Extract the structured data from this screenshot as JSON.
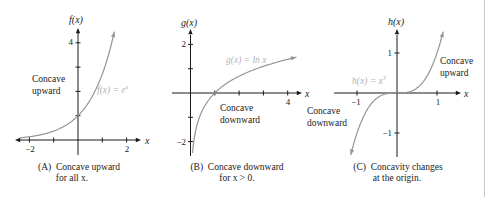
{
  "colors": {
    "axis": "#1a1a1a",
    "curve": "#949494",
    "curve_label": "#b2b2b2",
    "text": "#1a1a1a",
    "right_border": "#c6c6c6"
  },
  "chart_data": [
    {
      "type": "line",
      "panel": "A",
      "function": "f(x) = e^x",
      "fn": "exp",
      "title": "(A)  Concave upward",
      "title_line2": "for all x.",
      "y_axis_label": "f(x)",
      "x_axis_label": "x",
      "x_range_shown": [
        -2.6,
        2.6
      ],
      "y_range_shown": [
        -0.6,
        4.6
      ],
      "x_ticks": [
        -2,
        -1,
        1,
        2
      ],
      "y_ticks": [
        1,
        2,
        3,
        4
      ],
      "x_tick_labels": [
        {
          "value": -2,
          "text": "−2"
        },
        {
          "value": 2,
          "text": "2"
        }
      ],
      "y_tick_labels": [
        {
          "value": 4,
          "text": "4"
        }
      ],
      "key_points": [
        {
          "x": 0,
          "y": 1
        }
      ],
      "curve_label": {
        "base": "f(x) = e",
        "sup": "x"
      },
      "annotations": [
        {
          "role": "concavity-note",
          "lines": [
            "Concave",
            "upward"
          ]
        }
      ]
    },
    {
      "type": "line",
      "panel": "B",
      "function": "g(x) = ln x",
      "fn": "ln",
      "title": "(B)  Concave downward",
      "title_line2": "for x > 0.",
      "y_axis_label": "g(x)",
      "x_axis_label": "x",
      "x_range_shown": [
        -0.8,
        4.6
      ],
      "y_range_shown": [
        -2.6,
        2.6
      ],
      "x_ticks": [
        1,
        2,
        3,
        4
      ],
      "y_ticks": [
        -2,
        -1,
        1,
        2
      ],
      "x_tick_labels": [
        {
          "value": 4,
          "text": "4"
        }
      ],
      "y_tick_labels": [
        {
          "value": 2,
          "text": "2"
        },
        {
          "value": -2,
          "text": "−2"
        }
      ],
      "key_points": [
        {
          "x": 1,
          "y": 0
        }
      ],
      "curve_label": {
        "base": "g(x) = ln x",
        "sup": ""
      },
      "annotations": [
        {
          "role": "concavity-note",
          "lines": [
            "Concave",
            "downward"
          ]
        }
      ]
    },
    {
      "type": "line",
      "panel": "C",
      "function": "h(x) = x^3",
      "fn": "cube",
      "title": "(C)  Concavity changes",
      "title_line2": "at the origin.",
      "y_axis_label": "h(x)",
      "x_axis_label": "x",
      "x_range_shown": [
        -1.6,
        1.6
      ],
      "y_range_shown": [
        -1.6,
        1.6
      ],
      "x_ticks": [
        -1,
        1
      ],
      "y_ticks": [
        -1,
        1
      ],
      "x_tick_labels": [
        {
          "value": -1,
          "text": "−1"
        },
        {
          "value": 1,
          "text": "1"
        }
      ],
      "y_tick_labels": [
        {
          "value": 1,
          "text": "1"
        },
        {
          "value": -1,
          "text": "−1"
        }
      ],
      "key_points": [
        {
          "x": 0,
          "y": 0
        }
      ],
      "curve_label": {
        "base": "h(x) = x",
        "sup": "3"
      },
      "annotations": [
        {
          "role": "concavity-note",
          "lines": [
            "Concave",
            "upward"
          ]
        },
        {
          "role": "concavity-note",
          "lines": [
            "Concave",
            "downward"
          ]
        }
      ]
    }
  ]
}
